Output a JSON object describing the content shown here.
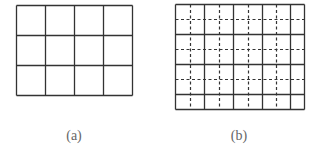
{
  "figure": {
    "panels": [
      {
        "id": "a",
        "caption": "(a)",
        "grid": {
          "x0": 16,
          "y0": 5,
          "x1": 132,
          "y1": 95,
          "cols": 4,
          "rows": 3,
          "solid_vertical": [
            16,
            45,
            74,
            103,
            132
          ],
          "solid_horizontal": [
            5,
            35,
            65,
            95
          ],
          "dashed_vertical": [],
          "dashed_horizontal": []
        }
      },
      {
        "id": "b",
        "caption": "(b)",
        "grid": {
          "x0": 175,
          "y0": 4,
          "x1": 304,
          "y1": 109,
          "solid_vertical": [
            175,
            204,
            233,
            262,
            290,
            304
          ],
          "solid_horizontal": [
            4,
            34,
            64,
            94,
            109
          ],
          "dashed_vertical": [
            190,
            219,
            248,
            276
          ],
          "dashed_horizontal": [
            19,
            49,
            79
          ]
        }
      }
    ],
    "colors": {
      "line": "#333333",
      "dash": "#333333",
      "caption": "#666666",
      "background": "#ffffff"
    }
  }
}
